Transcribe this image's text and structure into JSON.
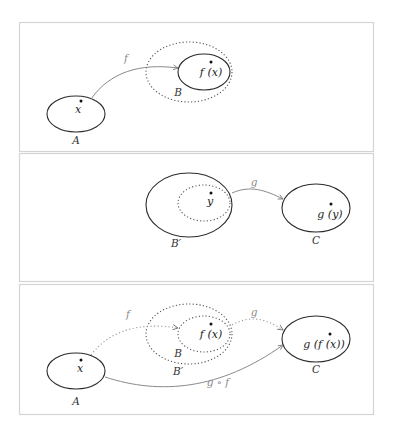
{
  "figure": {
    "panels": [
      {
        "id": "panel-1",
        "sets": [
          {
            "label": "A",
            "element": "x"
          },
          {
            "label": "B",
            "element": "f(x)",
            "dotted_outer": true
          }
        ],
        "arrows": [
          {
            "label": "f",
            "from": "A",
            "to": "B"
          }
        ]
      },
      {
        "id": "panel-2",
        "sets": [
          {
            "label": "B′",
            "element": "y",
            "dotted_inner": true
          },
          {
            "label": "C",
            "element": "g(y)"
          }
        ],
        "arrows": [
          {
            "label": "g",
            "from": "B′",
            "to": "C"
          }
        ]
      },
      {
        "id": "panel-3",
        "sets": [
          {
            "label": "A",
            "element": "x"
          },
          {
            "label": "B",
            "element": "f(x)"
          },
          {
            "label": "B′"
          },
          {
            "label": "C",
            "element": "g(f(x))"
          }
        ],
        "arrows": [
          {
            "label": "f",
            "from": "A",
            "to": "B",
            "style": "dotted"
          },
          {
            "label": "g",
            "from": "B",
            "to": "C",
            "style": "dotted"
          },
          {
            "label": "g ∘ f",
            "from": "A",
            "to": "C",
            "style": "solid"
          }
        ]
      }
    ],
    "text": {
      "p1": {
        "x": "x",
        "fx": "f (x)",
        "A": "A",
        "B": "B",
        "f": "f"
      },
      "p2": {
        "y": "y",
        "gy": "g (y)",
        "Bp": "B′",
        "C": "C",
        "g": "g"
      },
      "p3": {
        "x": "x",
        "fx": "f (x)",
        "gfx": "g (f (x))",
        "A": "A",
        "B": "B",
        "Bp": "B′",
        "C": "C",
        "f": "f",
        "g": "g",
        "gof": "g ∘ f"
      }
    },
    "colors": {
      "set_stroke": "#2b2b2b",
      "arrow_stroke": "#8a8a8a",
      "panel_border": "#d4d4d4"
    }
  }
}
